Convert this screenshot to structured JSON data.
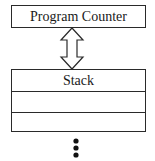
{
  "diagram": {
    "program_counter": {
      "label": "Program Counter"
    },
    "connector": {
      "type": "double-headed-arrow",
      "direction": "vertical"
    },
    "stack": {
      "label": "Stack",
      "rows": [
        "Stack",
        "",
        ""
      ]
    },
    "continuation": {
      "type": "vertical-ellipsis",
      "dots": 3
    }
  },
  "colors": {
    "stroke": "#2a2a2a",
    "fill": "#ffffff",
    "text": "#1a1a1a"
  }
}
